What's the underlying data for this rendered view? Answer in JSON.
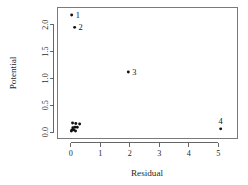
{
  "chart_data": {
    "type": "scatter",
    "title": "",
    "xlabel": "Residual",
    "ylabel": "Potential",
    "xlim": [
      -0.45,
      5.65
    ],
    "ylim": [
      -0.12,
      2.32
    ],
    "xticks": [
      0,
      1,
      2,
      3,
      4,
      5
    ],
    "xticklabels": [
      "0",
      "1",
      "2",
      "3",
      "4",
      "5"
    ],
    "yticks": [
      0.0,
      0.5,
      1.0,
      1.5,
      2.0
    ],
    "yticklabels": [
      "0.0",
      "0.5",
      "1.0",
      "1.5",
      "2.0"
    ],
    "grid": false,
    "legend": null,
    "point_color": "#111111",
    "axis_color": "#555555",
    "frame": true,
    "labeled_points": [
      {
        "label": "1",
        "x": 0.03,
        "y": 2.18,
        "label_pos": "right"
      },
      {
        "label": "2",
        "x": 0.13,
        "y": 1.95,
        "label_pos": "right"
      },
      {
        "label": "3",
        "x": 1.95,
        "y": 1.12,
        "label_pos": "right"
      },
      {
        "label": "4",
        "x": 5.08,
        "y": 0.06,
        "label_pos": "above"
      }
    ],
    "unlabeled_points": [
      {
        "x": 0.06,
        "y": 0.17
      },
      {
        "x": 0.17,
        "y": 0.16
      },
      {
        "x": 0.3,
        "y": 0.15
      },
      {
        "x": 0.07,
        "y": 0.08
      },
      {
        "x": 0.14,
        "y": 0.09
      },
      {
        "x": 0.22,
        "y": 0.09
      },
      {
        "x": 0.04,
        "y": 0.04
      },
      {
        "x": 0.1,
        "y": 0.04
      },
      {
        "x": 0.02,
        "y": 0.02
      },
      {
        "x": 0.16,
        "y": 0.02
      }
    ]
  }
}
